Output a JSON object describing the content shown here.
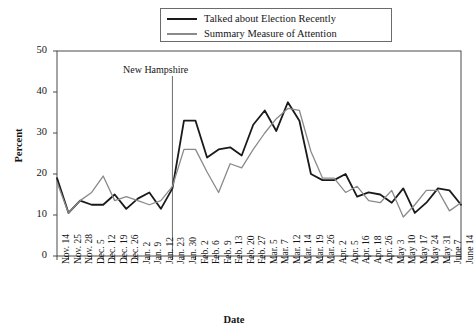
{
  "chart_data": {
    "type": "line",
    "title": "",
    "xlabel": "Date",
    "ylabel": "Percent",
    "ylim": [
      0,
      50
    ],
    "yticks": [
      0,
      10,
      20,
      30,
      40,
      50
    ],
    "grid": false,
    "legend_position": "top-center",
    "annotations": [
      {
        "text": "New Hampshire",
        "x": "Jan. 23",
        "type": "vertical-line-label"
      }
    ],
    "categories": [
      "Nov. 14",
      "Nov. 25",
      "Nov. 28",
      "Dec. 5",
      "Dec. 12",
      "Dec. 19",
      "Dec. 26",
      "Jan. 2",
      "Jan. 9",
      "Jan. 12",
      "Jan. 23",
      "Jan. 30",
      "Feb. 2",
      "Feb. 6",
      "Feb. 9",
      "Feb. 13",
      "Feb. 20",
      "Feb. 27",
      "Mar. 5",
      "Mar. 7",
      "Mar. 12",
      "Mar. 14",
      "Mar. 19",
      "Mar. 26",
      "Apr. 2",
      "Apr. 5",
      "Apr. 16",
      "Apr. 18",
      "Apr. 26",
      "May 3",
      "May 10",
      "May 17",
      "May 24",
      "May 31",
      "June 7",
      "June 14"
    ],
    "series": [
      {
        "name": "Talked about Election Recently",
        "color": "#1a1a1a",
        "values": [
          19,
          10.5,
          13.5,
          12.5,
          12.5,
          15,
          11.5,
          14,
          15.5,
          11.5,
          16.5,
          33,
          33,
          24,
          26,
          26.5,
          24.5,
          32,
          35.5,
          30.5,
          37.5,
          33,
          20,
          18.5,
          18.5,
          20,
          14.5,
          15.5,
          15,
          13,
          16.5,
          10.5,
          13,
          16.5,
          16,
          12.5
        ]
      },
      {
        "name": "Summary Measure of Attention",
        "color": "#8a8a8a",
        "values": [
          18,
          10.5,
          13.5,
          15.5,
          19.5,
          13.5,
          14.5,
          13.5,
          12.5,
          13.5,
          17,
          26,
          26,
          20.5,
          15.5,
          22.5,
          21.5,
          26,
          30,
          33.5,
          36,
          35.5,
          25.5,
          19,
          19,
          15.5,
          17,
          13.5,
          13,
          16,
          9.5,
          12.5,
          16,
          16,
          11,
          13
        ]
      }
    ]
  },
  "legend": {
    "entries": [
      {
        "label": "Talked about Election Recently"
      },
      {
        "label": "Summary Measure of Attention"
      }
    ]
  },
  "axes": {
    "y_title": "Percent",
    "x_title": "Date"
  }
}
